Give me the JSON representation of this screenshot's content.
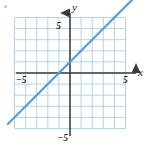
{
  "figure": {
    "name": "coordinate-plane-with-line",
    "background_color": "#ffffff",
    "width": 148,
    "height": 146
  },
  "axes": {
    "x_axis_label": "x",
    "y_axis_label": "y",
    "axis_color": "#3a3a3a",
    "arrow_style": "solid-triangle",
    "origin_px": {
      "x": 70,
      "y": 73
    },
    "unit_px": 11.1
  },
  "ticks": {
    "x_positive_label": "5",
    "x_negative_label": "−5",
    "y_positive_label": "5",
    "y_negative_label": "−5"
  },
  "grid": {
    "color": "#a8cdea",
    "minor_color": "#c9e0f3",
    "columns": 10,
    "rows": 10,
    "show": true,
    "x_from": -5,
    "x_to": 5,
    "y_from": -5,
    "y_to": 5
  },
  "decoration": {
    "corner_mark": "•"
  },
  "chart_data": {
    "type": "line",
    "title": "",
    "xlabel": "x",
    "ylabel": "y",
    "xlim": [
      -5,
      5
    ],
    "ylim": [
      -5,
      5
    ],
    "xticks": [
      -5,
      5
    ],
    "yticks": [
      -5,
      5
    ],
    "xtick_labels": [
      "−5",
      "5"
    ],
    "ytick_labels": [
      "−5",
      "5"
    ],
    "grid": true,
    "legend": "none",
    "series": [
      {
        "name": "line",
        "color": "#5b9bd5",
        "slope": 1,
        "intercept": 1,
        "equation": "y = x + 1",
        "x": [
          -5.0,
          5.0
        ],
        "y": [
          -4.0,
          6.0
        ],
        "x_intercept": -1,
        "y_intercept": 1,
        "points": [
          {
            "x": -5,
            "y": -4
          },
          {
            "x": -1,
            "y": 0
          },
          {
            "x": 0,
            "y": 1
          },
          {
            "x": 4,
            "y": 5
          },
          {
            "x": 5,
            "y": 6
          }
        ]
      }
    ]
  }
}
